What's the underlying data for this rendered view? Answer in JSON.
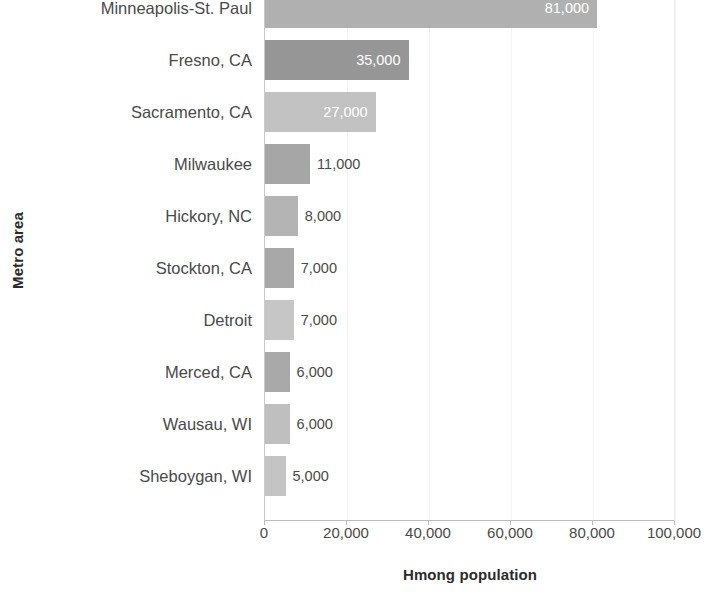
{
  "chart_data": {
    "type": "bar",
    "orientation": "horizontal",
    "title": "",
    "xlabel": "Hmong population",
    "ylabel": "Metro area",
    "categories": [
      "Minneapolis-St. Paul",
      "Fresno, CA",
      "Sacramento, CA",
      "Milwaukee",
      "Hickory, NC",
      "Stockton, CA",
      "Detroit",
      "Merced, CA",
      "Wausau, WI",
      "Sheboygan, WI"
    ],
    "values": [
      81000,
      35000,
      27000,
      11000,
      8000,
      7000,
      7000,
      6000,
      6000,
      5000
    ],
    "value_labels": [
      "81,000",
      "35,000",
      "27,000",
      "11,000",
      "8,000",
      "7,000",
      "7,000",
      "6,000",
      "6,000",
      "5,000"
    ],
    "bar_colors": [
      "#b0b0b0",
      "#969696",
      "#c2c2c2",
      "#a6a6a6",
      "#b4b4b4",
      "#a8a8a8",
      "#c6c6c6",
      "#a9a9a9",
      "#bfbfbf",
      "#c4c4c4"
    ],
    "label_placement": [
      "inside",
      "inside",
      "inside",
      "outside",
      "outside",
      "outside",
      "outside",
      "outside",
      "outside",
      "outside"
    ],
    "xlim": [
      0,
      100000
    ],
    "xticks": [
      0,
      20000,
      40000,
      60000,
      80000,
      100000
    ],
    "xtick_labels": [
      "0",
      "20,000",
      "40,000",
      "60,000",
      "80,000",
      "100,000"
    ],
    "grid": true,
    "grid_axis": "x",
    "legend": false,
    "axis_color": "#bdbdbd",
    "grid_color": "#f4f4f4",
    "text_color": "#4a4a4a"
  }
}
